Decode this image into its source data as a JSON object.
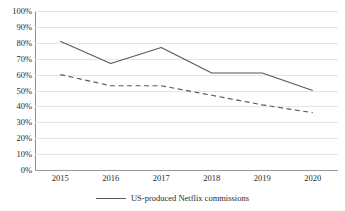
{
  "chart_data": {
    "type": "line",
    "title": "",
    "xlabel": "",
    "ylabel": "",
    "categories": [
      "2015",
      "2016",
      "2017",
      "2018",
      "2019",
      "2020"
    ],
    "ylim": [
      0,
      100
    ],
    "yticks": [
      "0%",
      "10%",
      "20%",
      "30%",
      "40%",
      "50%",
      "60%",
      "70%",
      "80%",
      "90%",
      "100%"
    ],
    "ytick_values": [
      0,
      10,
      20,
      30,
      40,
      50,
      60,
      70,
      80,
      90,
      100
    ],
    "grid": true,
    "legend_position": "bottom",
    "series": [
      {
        "name": "US-produced Netflix commissions",
        "style": "solid",
        "color": "#595959",
        "in_legend": true,
        "values": [
          81,
          67,
          77,
          61,
          61,
          50
        ]
      },
      {
        "name": "",
        "style": "dashed",
        "color": "#595959",
        "in_legend": false,
        "values": [
          60,
          53,
          53,
          47,
          41,
          36
        ]
      }
    ]
  },
  "legend": {
    "entries": [
      {
        "label": "US-produced Netflix commissions"
      }
    ]
  },
  "colors": {
    "series_line": "#595959",
    "gridline": "#e4e4e4",
    "axis": "#8d8d8d",
    "text": "#2b2b2b",
    "background": "#ffffff"
  }
}
